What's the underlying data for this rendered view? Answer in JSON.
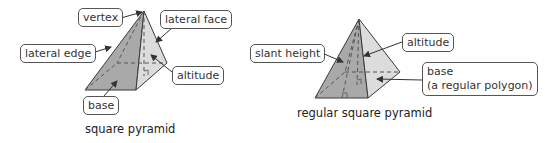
{
  "figures": [
    {
      "caption": "square pyramid",
      "labels": {
        "vertex": "vertex",
        "lateral_face": "lateral face",
        "lateral_edge": "lateral edge",
        "altitude": "altitude",
        "base": "base"
      }
    },
    {
      "caption": "regular square pyramid",
      "labels": {
        "slant_height": "slant height",
        "altitude": "altitude",
        "base_line1": "base",
        "base_line2": "(a regular polygon)"
      }
    }
  ],
  "colors": {
    "front_face": "#a9a9a9",
    "right_face": "#d9d9d9",
    "edge": "#3a3a3a",
    "label_border": "#555555"
  }
}
